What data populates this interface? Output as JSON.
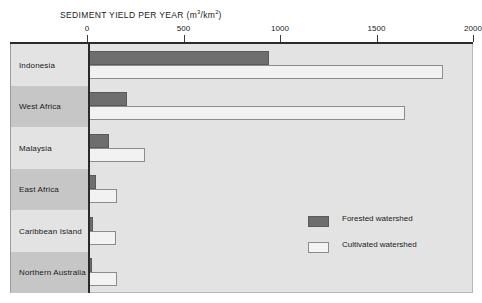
{
  "chart_data": {
    "type": "bar",
    "orientation": "horizontal",
    "title": "SEDIMENT YIELD PER YEAR (m3/km2)",
    "title_main": "SEDIMENT YIELD PER YEAR (m",
    "title_sup1": "3",
    "title_mid": "/km",
    "title_sup2": "2",
    "title_end": ")",
    "xlabel": "",
    "ylabel": "",
    "xlim": [
      0,
      2000
    ],
    "grid": false,
    "legend_position": "inside-right",
    "categories": [
      "Indonesia",
      "West Africa",
      "Malaysia",
      "East Africa",
      "Caribbean Island",
      "Northern Australia"
    ],
    "tick_values": [
      0,
      500,
      1000,
      1500,
      2000
    ],
    "tick_labels": [
      "0",
      "500",
      "1000",
      "1500",
      "2000"
    ],
    "series": [
      {
        "name": "Forested watershed",
        "color": "#6e6e6e",
        "values": [
          940,
          200,
          110,
          40,
          25,
          20
        ]
      },
      {
        "name": "Cultivated watershed",
        "color": "#f2f2f2",
        "values": [
          1840,
          1640,
          295,
          150,
          145,
          150
        ]
      }
    ]
  },
  "legend": {
    "items": [
      {
        "label": "Forested watershed",
        "swatch": "forested"
      },
      {
        "label": "Cultivated watershed",
        "swatch": "cultivated"
      }
    ]
  }
}
